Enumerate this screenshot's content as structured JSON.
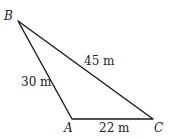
{
  "diagram": {
    "type": "triangle",
    "vertices": [
      {
        "name": "B",
        "x": 18,
        "y": 21,
        "label_x": 4,
        "label_y": 20
      },
      {
        "name": "A",
        "x": 72,
        "y": 119,
        "label_x": 64,
        "label_y": 132
      },
      {
        "name": "C",
        "x": 153,
        "y": 119,
        "label_x": 154,
        "label_y": 132
      }
    ],
    "sides": [
      {
        "from": "B",
        "to": "C",
        "label": "45 m",
        "label_x": 84,
        "label_y": 65
      },
      {
        "from": "B",
        "to": "A",
        "label": "30 m",
        "label_x": 21,
        "label_y": 86
      },
      {
        "from": "A",
        "to": "C",
        "label": "22 m",
        "label_x": 99,
        "label_y": 132
      }
    ],
    "stroke_color": "#1a1a1a"
  }
}
